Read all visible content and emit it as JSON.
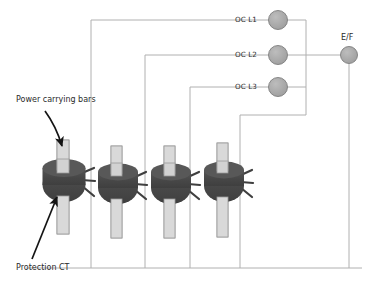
{
  "diagram": {
    "type": "electrical-schematic",
    "colors": {
      "wire": "#b0b0b0",
      "ct_core": "#4a4a4a",
      "ct_core_top": "#595959",
      "bar_fill": "#d9d9d9",
      "bar_stroke": "#9a9a9a",
      "relay_fill": "#a8a8a8",
      "relay_stroke": "#7d7d7d",
      "annotation": "#1a1a1a",
      "background": "#ffffff"
    },
    "relays": [
      {
        "id": "oc-l1",
        "label": "OC L1",
        "cx": 278,
        "cy": 20,
        "r": 9.5
      },
      {
        "id": "oc-l2",
        "label": "OC L2",
        "cx": 278,
        "cy": 55,
        "r": 9.5
      },
      {
        "id": "oc-l3",
        "label": "OC L3",
        "cx": 278,
        "cy": 87,
        "r": 9.5
      },
      {
        "id": "ef",
        "label": "E/F",
        "cx": 349,
        "cy": 55,
        "r": 8.5
      }
    ],
    "current_transformers": [
      {
        "id": "ct-1",
        "cx": 64,
        "cy": 185,
        "label": "Protection CT"
      },
      {
        "id": "ct-2",
        "cx": 118,
        "cy": 188,
        "label": "Protection CT"
      },
      {
        "id": "ct-3",
        "cx": 171,
        "cy": 188,
        "label": "Protection CT"
      },
      {
        "id": "ct-4",
        "cx": 224,
        "cy": 186,
        "label": "Protection CT"
      }
    ],
    "annotations": [
      {
        "id": "power-bars",
        "label": "Power carrying bars",
        "x": 16,
        "y": 100
      },
      {
        "id": "protection-ct",
        "label": "Protection CT",
        "x": 16,
        "y": 268
      }
    ],
    "bus": {
      "bottom_y": 268,
      "bottom_x_start": 26,
      "bottom_x_end": 362,
      "collector_x": 306,
      "ef_feed_y": 55
    }
  }
}
